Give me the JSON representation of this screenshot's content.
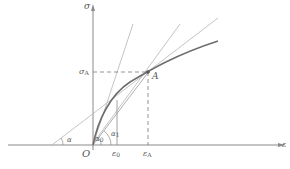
{
  "diagram": {
    "axes": {
      "y_label": "σ",
      "x_label": "ε",
      "origin_label": "O"
    },
    "points": {
      "A": "A",
      "sigma_A": "σ",
      "sigma_A_sub": "A",
      "epsilon_0": "ε",
      "epsilon_0_sub": "0",
      "epsilon_A": "ε",
      "epsilon_A_sub": "A"
    },
    "angles": {
      "alpha": "α",
      "alpha_0": "α",
      "alpha_0_sub": "0",
      "alpha_1": "α",
      "alpha_1_sub": "1"
    },
    "colors": {
      "axis": "#8a8a8a",
      "curve": "#6e6e6e",
      "thin_line": "#b5b5b5",
      "dashed": "#7a7a7a",
      "text": "#555555"
    }
  }
}
